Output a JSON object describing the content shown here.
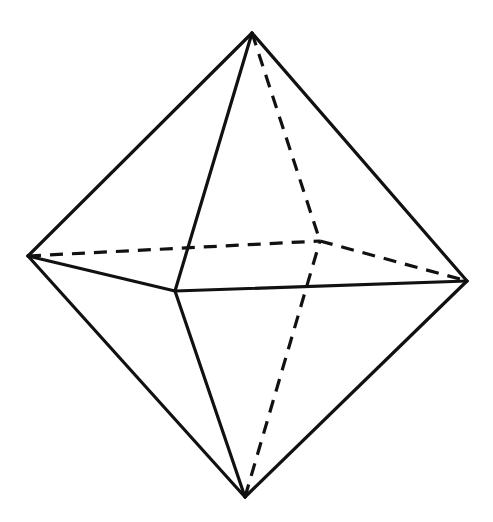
{
  "diagram": {
    "title": "",
    "shape": "octahedron",
    "colors": {
      "background": "#ffffff",
      "stroke": "#111111"
    },
    "vertices": {
      "top": [
        252,
        33
      ],
      "left": [
        28,
        256
      ],
      "right": [
        467,
        281
      ],
      "front": [
        175,
        291
      ],
      "back": [
        320,
        241
      ],
      "bottom": [
        245,
        497
      ]
    },
    "edges": [
      {
        "from": "top",
        "to": "left",
        "style": "solid"
      },
      {
        "from": "top",
        "to": "right",
        "style": "solid"
      },
      {
        "from": "top",
        "to": "front",
        "style": "solid"
      },
      {
        "from": "top",
        "to": "back",
        "style": "dashed"
      },
      {
        "from": "left",
        "to": "front",
        "style": "solid"
      },
      {
        "from": "front",
        "to": "right",
        "style": "solid"
      },
      {
        "from": "left",
        "to": "back",
        "style": "dashed"
      },
      {
        "from": "back",
        "to": "right",
        "style": "dashed"
      },
      {
        "from": "bottom",
        "to": "left",
        "style": "solid"
      },
      {
        "from": "bottom",
        "to": "right",
        "style": "solid"
      },
      {
        "from": "bottom",
        "to": "front",
        "style": "solid"
      },
      {
        "from": "bottom",
        "to": "back",
        "style": "dashed"
      }
    ]
  }
}
